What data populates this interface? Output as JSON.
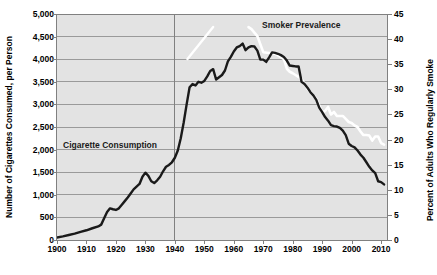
{
  "chart_data": {
    "type": "line",
    "title": "",
    "xlabel": "",
    "grid": true,
    "legend_position": "in-plot annotations",
    "xlim": [
      1900,
      2012
    ],
    "x_ticks": [
      1900,
      1910,
      1920,
      1930,
      1940,
      1950,
      1960,
      1970,
      1980,
      1990,
      2000,
      2010
    ],
    "x_tick_labels": [
      "1900",
      "1910",
      "1920",
      "1930",
      "1940",
      "1950",
      "1960",
      "1970",
      "1980",
      "1990",
      "2000",
      "2010"
    ],
    "axes": [
      {
        "side": "left",
        "label": "Number of Cigarettes Consumed, per Person",
        "ylim": [
          0,
          5000
        ],
        "ticks": [
          0,
          500,
          1000,
          1500,
          2000,
          2500,
          3000,
          3500,
          4000,
          4500,
          5000
        ],
        "tick_labels": [
          "0",
          "500",
          "1,000",
          "1,500",
          "2,000",
          "2,500",
          "3,000",
          "3,500",
          "4,000",
          "4,500",
          "5,000"
        ]
      },
      {
        "side": "right",
        "label": "Percent of Adults Who Regularly Smoke",
        "ylim": [
          0,
          45
        ],
        "ticks": [
          0,
          5,
          10,
          15,
          20,
          25,
          30,
          35,
          40,
          45
        ],
        "tick_labels": [
          "0",
          "5",
          "10",
          "15",
          "20",
          "25",
          "30",
          "35",
          "40",
          "45"
        ]
      }
    ],
    "series": [
      {
        "name": "Cigarette Consumption",
        "axis": "left",
        "color": "#1a1a1a",
        "unit": "cigarettes per person per year",
        "annotation_label": "Cigarette Consumption",
        "x": [
          1900,
          1902,
          1904,
          1906,
          1908,
          1910,
          1912,
          1914,
          1915,
          1916,
          1917,
          1918,
          1919,
          1920,
          1921,
          1922,
          1923,
          1924,
          1925,
          1926,
          1927,
          1928,
          1929,
          1930,
          1931,
          1932,
          1933,
          1934,
          1935,
          1936,
          1937,
          1938,
          1939,
          1940,
          1941,
          1942,
          1943,
          1944,
          1945,
          1946,
          1947,
          1948,
          1949,
          1950,
          1951,
          1952,
          1953,
          1954,
          1955,
          1956,
          1957,
          1958,
          1959,
          1960,
          1961,
          1962,
          1963,
          1964,
          1965,
          1966,
          1967,
          1968,
          1969,
          1970,
          1971,
          1972,
          1973,
          1974,
          1975,
          1976,
          1977,
          1978,
          1979,
          1980,
          1981,
          1982,
          1983,
          1984,
          1985,
          1986,
          1987,
          1988,
          1989,
          1990,
          1991,
          1992,
          1993,
          1994,
          1995,
          1996,
          1997,
          1998,
          1999,
          2000,
          2001,
          2002,
          2003,
          2004,
          2005,
          2006,
          2007,
          2008,
          2009,
          2010,
          2011
        ],
        "y": [
          54,
          80,
          110,
          140,
          180,
          215,
          260,
          300,
          340,
          480,
          620,
          700,
          680,
          665,
          700,
          780,
          860,
          940,
          1030,
          1120,
          1180,
          1240,
          1400,
          1490,
          1420,
          1300,
          1260,
          1320,
          1400,
          1520,
          1620,
          1660,
          1720,
          1820,
          1980,
          2250,
          2600,
          3000,
          3380,
          3450,
          3420,
          3500,
          3480,
          3520,
          3620,
          3740,
          3780,
          3550,
          3600,
          3650,
          3750,
          3950,
          4050,
          4170,
          4260,
          4290,
          4345,
          4200,
          4260,
          4290,
          4280,
          4190,
          3990,
          3990,
          3940,
          4040,
          4150,
          4140,
          4120,
          4090,
          4050,
          3970,
          3860,
          3850,
          3840,
          3840,
          3500,
          3450,
          3370,
          3270,
          3200,
          3100,
          2930,
          2830,
          2720,
          2640,
          2540,
          2520,
          2510,
          2480,
          2420,
          2320,
          2130,
          2080,
          2050,
          1980,
          1890,
          1820,
          1720,
          1620,
          1540,
          1480,
          1300,
          1280,
          1230
        ]
      },
      {
        "name": "Smoker Prevalence",
        "axis": "right",
        "color": "#ffffff",
        "unit": "percent of adults who regularly smoke",
        "annotation_label": "Smoker Prevalence",
        "x": [
          1965,
          1966,
          1968,
          1970,
          1974,
          1976,
          1977,
          1978,
          1979,
          1980,
          1983,
          1985,
          1987,
          1988,
          1990,
          1991,
          1992,
          1993,
          1994,
          1995,
          1997,
          1998,
          1999,
          2000,
          2001,
          2002,
          2003,
          2004,
          2005,
          2006,
          2007,
          2008,
          2009,
          2010,
          2011
        ],
        "y": [
          42.4,
          42.0,
          40.6,
          37.4,
          37.1,
          36.4,
          36.0,
          34.1,
          33.5,
          33.2,
          32.1,
          30.1,
          28.8,
          28.1,
          25.5,
          25.7,
          26.5,
          25.0,
          25.5,
          24.7,
          24.7,
          24.1,
          23.5,
          23.3,
          22.8,
          22.5,
          21.6,
          20.9,
          20.9,
          20.8,
          19.8,
          20.6,
          20.6,
          19.3,
          19.0
        ]
      }
    ],
    "vertical_reference_line": {
      "x": 1940,
      "color": "#808080"
    },
    "annotations": [
      {
        "text": "Cigarette Consumption",
        "x": 1903,
        "y_left": 2150
      },
      {
        "text": "Smoker Prevalence",
        "x": 1972,
        "y_right": 44
      }
    ]
  },
  "plot": {
    "background_color": "#e3e3e3",
    "gridline_color": "#9a9a9a",
    "axis_color": "#808080",
    "page_background": "#ffffff"
  }
}
